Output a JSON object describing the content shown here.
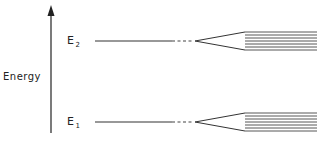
{
  "diagram": {
    "axis": {
      "label": "Energy",
      "direction": "up"
    },
    "levels": [
      {
        "id": "E2",
        "base": "E",
        "subscript": "2",
        "y": 41,
        "band_lines": 7
      },
      {
        "id": "E1",
        "base": "E",
        "subscript": "1",
        "y": 122,
        "band_lines": 7
      }
    ]
  }
}
